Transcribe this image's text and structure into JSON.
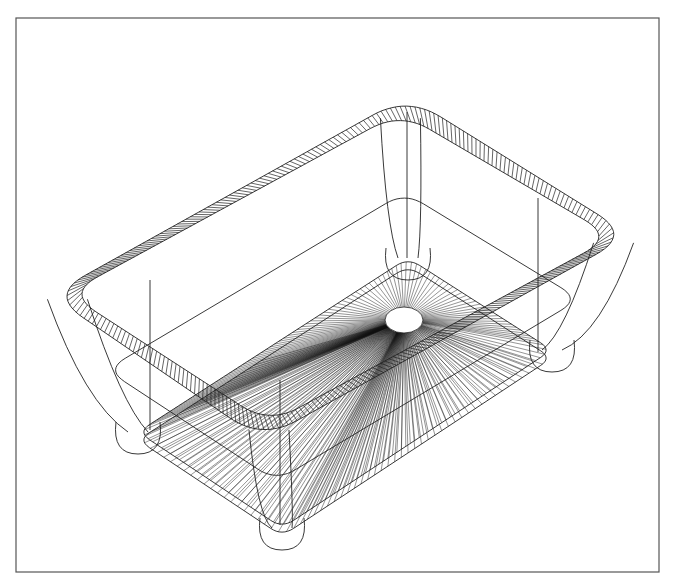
{
  "figure": {
    "colors": {
      "background": "#ffffff",
      "line": "#222222",
      "frame": "#555555",
      "drain_fill": "#ffffff"
    },
    "frame": {
      "x": 16,
      "y": 18,
      "width": 643,
      "height": 554
    },
    "rim": {
      "outer_corners": {
        "top": [
          407,
          96
        ],
        "right": [
          631,
          235
        ],
        "bottom": [
          262,
          440
        ],
        "left": [
          50,
          295
        ]
      },
      "band_width": 14,
      "corner_radius": 40,
      "hatch_spacing": 5
    },
    "bottom_plate": {
      "corners": {
        "top": [
          408,
          258
        ],
        "right": [
          552,
          350
        ],
        "bottom": [
          282,
          528
        ],
        "left": [
          138,
          432
        ]
      },
      "corner_radius": 14
    },
    "drain": {
      "cx": 404,
      "cy": 320,
      "rx": 19,
      "ry": 13
    },
    "vertical_edges": [
      {
        "x": 407,
        "y1": 112,
        "y2": 258
      },
      {
        "x": 150,
        "y1": 280,
        "y2": 430
      },
      {
        "x": 538,
        "y1": 198,
        "y2": 352
      },
      {
        "x": 280,
        "y1": 380,
        "y2": 525
      }
    ],
    "ray_count": 180
  }
}
